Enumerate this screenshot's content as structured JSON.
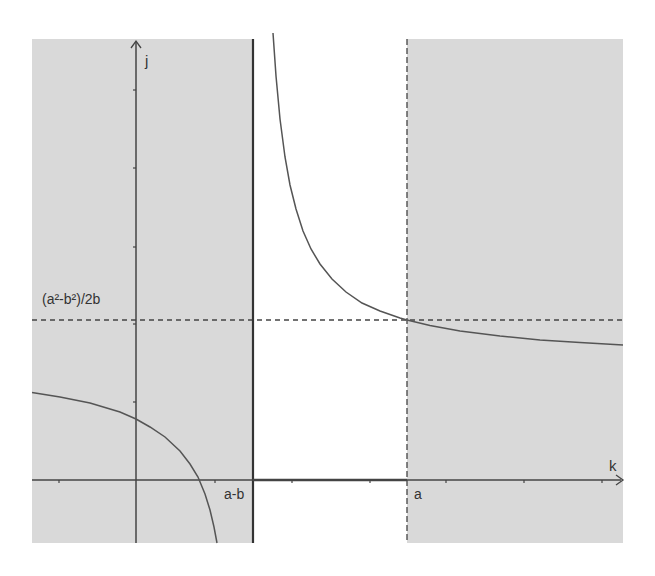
{
  "diagram": {
    "type": "function graph with shaded forbidden regions",
    "axes": {
      "x_label": "k",
      "y_label": "j"
    },
    "labels": {
      "vertical_asymptote_left": "a-b",
      "vertical_line_right": "a",
      "horizontal_line": "(a²-b²)/2b"
    },
    "colors": {
      "shade": "#d9d9d9",
      "curve": "#555555",
      "axis": "#444444",
      "dashed": "#444444",
      "background": "#ffffff"
    },
    "regions": [
      {
        "name": "shaded-left",
        "from": "plot-left",
        "to": "a-b"
      },
      {
        "name": "unshaded-middle",
        "from": "a-b",
        "to": "a"
      },
      {
        "name": "shaded-right",
        "from": "a",
        "to": "plot-right"
      }
    ],
    "curve": {
      "kind": "hyperbola",
      "vertical_asymptote": "k = a-b",
      "passes_through": "(a, (a²-b²)/2b)"
    },
    "highlighted_segment": "k-axis between a-b and a"
  }
}
